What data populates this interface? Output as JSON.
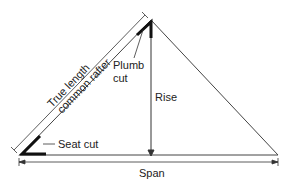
{
  "diagram": {
    "labels": {
      "true_length_line1": "True length",
      "true_length_line2": "common rafter",
      "plumb_line1": "Plumb",
      "plumb_line2": "cut",
      "rise": "Rise",
      "seat_cut": "Seat cut",
      "span": "Span"
    },
    "colors": {
      "line": "#333333",
      "bold": "#111111",
      "background": "#ffffff"
    }
  }
}
